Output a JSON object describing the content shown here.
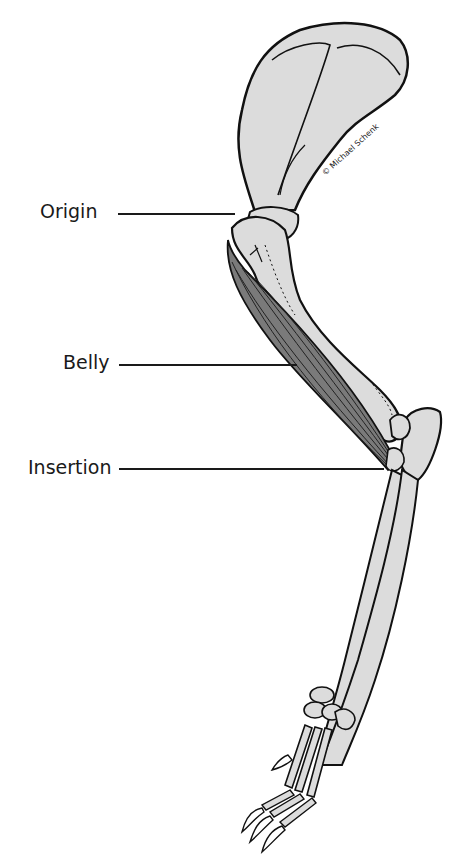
{
  "diagram": {
    "labels": [
      {
        "id": "origin",
        "text": "Origin"
      },
      {
        "id": "belly",
        "text": "Belly"
      },
      {
        "id": "insertion",
        "text": "Insertion"
      }
    ],
    "credit": "© Michael Schenk",
    "colors": {
      "bone_fill": "#dcdcdc",
      "muscle_fill": "#7a7a7a",
      "outline": "#111111",
      "text": "#1a1a1a"
    }
  }
}
